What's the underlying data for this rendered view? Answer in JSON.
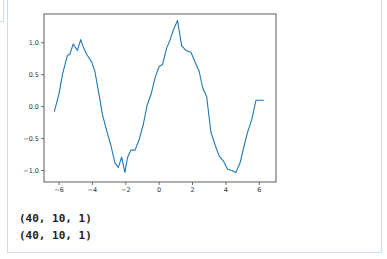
{
  "output_cell": {
    "stdout_lines": [
      "(40, 10, 1)",
      "(40, 10, 1)"
    ]
  },
  "colors": {
    "line": "#1f77b4",
    "axes": "#333333",
    "cell_border": "#cfdbe8"
  },
  "chart_data": {
    "type": "line",
    "title": "",
    "xlabel": "",
    "ylabel": "",
    "xlim": [
      -6.9,
      7.0
    ],
    "ylim": [
      -1.18,
      1.45
    ],
    "grid": false,
    "legend": null,
    "xticks": [
      -6,
      -4,
      -2,
      0,
      2,
      4,
      6
    ],
    "xtick_labels": [
      "−6",
      "−4",
      "−2",
      "0",
      "2",
      "4",
      "6"
    ],
    "yticks": [
      -1.0,
      -0.5,
      0.0,
      0.5,
      1.0
    ],
    "ytick_labels": [
      "−1.0",
      "−0.5",
      "0.0",
      "0.5",
      "1.0"
    ],
    "series": [
      {
        "name": "noisy sine",
        "x": [
          -6.28,
          -6.0,
          -5.8,
          -5.6,
          -5.5,
          -5.35,
          -5.15,
          -4.9,
          -4.7,
          -4.5,
          -4.3,
          -4.05,
          -3.85,
          -3.6,
          -3.4,
          -3.15,
          -2.9,
          -2.65,
          -2.45,
          -2.25,
          -2.05,
          -1.9,
          -1.7,
          -1.45,
          -1.2,
          -0.95,
          -0.72,
          -0.48,
          -0.25,
          0.0,
          0.2,
          0.45,
          0.65,
          0.85,
          1.1,
          1.35,
          1.6,
          1.9,
          2.4,
          2.6,
          2.85,
          3.1,
          3.35,
          3.6,
          3.85,
          4.1,
          4.35,
          4.6,
          4.85,
          5.05,
          5.3,
          5.55,
          5.8,
          6.05,
          6.28
        ],
        "y": [
          -0.08,
          0.2,
          0.5,
          0.7,
          0.8,
          0.82,
          0.98,
          0.88,
          1.05,
          0.9,
          0.8,
          0.7,
          0.55,
          0.18,
          -0.12,
          -0.37,
          -0.6,
          -0.88,
          -0.95,
          -0.79,
          -1.03,
          -0.8,
          -0.68,
          -0.68,
          -0.52,
          -0.28,
          0.02,
          0.2,
          0.45,
          0.63,
          0.66,
          0.92,
          1.04,
          1.2,
          1.35,
          0.95,
          0.88,
          0.85,
          0.55,
          0.3,
          0.15,
          -0.4,
          -0.6,
          -0.78,
          -0.85,
          -0.98,
          -1.0,
          -1.03,
          -0.88,
          -0.65,
          -0.4,
          -0.2,
          0.1,
          0.1,
          0.1
        ]
      }
    ]
  }
}
